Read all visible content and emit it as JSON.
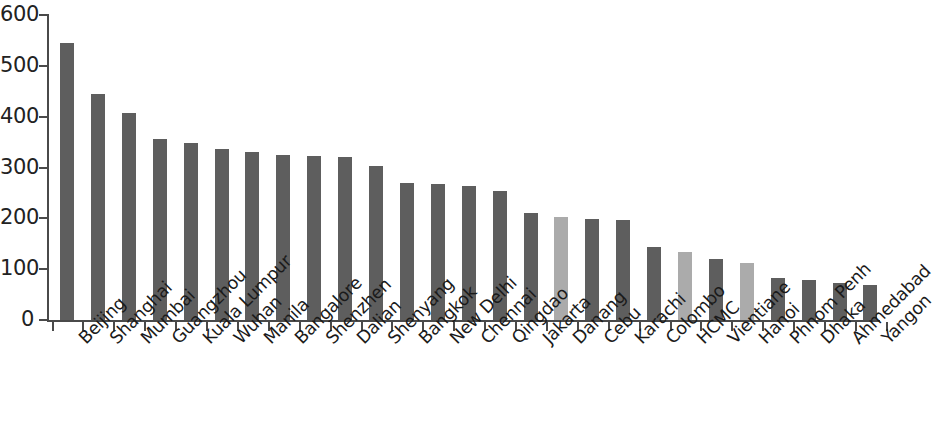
{
  "chart_data": {
    "type": "bar",
    "title": "",
    "subtitle": "",
    "xlabel": "",
    "ylabel": "",
    "ylim": [
      0,
      600
    ],
    "ytick_labels": [
      "0",
      "100",
      "200",
      "300",
      "400",
      "500",
      "600"
    ],
    "ytick_values": [
      0,
      100,
      200,
      300,
      400,
      500,
      600
    ],
    "grid": false,
    "legend": null,
    "categories": [
      "Beijing",
      "Shanghai",
      "Mumbai",
      "Guangzhou",
      "Kuala Lumpur",
      "Wuhan",
      "Manila",
      "Bangalore",
      "Shenzhen",
      "Dalian",
      "Shenyang",
      "Bangkok",
      "New Delhi",
      "Chennai",
      "Qingdao",
      "Jakarta",
      "Danang",
      "Cebu",
      "Karachi",
      "Colombo",
      "HCMC",
      "Vientiane",
      "Hanoi",
      "Phnom Penh",
      "Dhaka",
      "Ahmedabad",
      "Yangon"
    ],
    "values": [
      545,
      444,
      408,
      357,
      348,
      337,
      330,
      325,
      322,
      321,
      303,
      269,
      268,
      263,
      254,
      211,
      203,
      199,
      197,
      143,
      133,
      120,
      112,
      83,
      79,
      73,
      68
    ],
    "bar_colors": [
      "#5e5e5e",
      "#5e5e5e",
      "#5e5e5e",
      "#5e5e5e",
      "#5e5e5e",
      "#5e5e5e",
      "#5e5e5e",
      "#5e5e5e",
      "#5e5e5e",
      "#5e5e5e",
      "#5e5e5e",
      "#5e5e5e",
      "#5e5e5e",
      "#5e5e5e",
      "#5e5e5e",
      "#5e5e5e",
      "#ababab",
      "#5e5e5e",
      "#5e5e5e",
      "#5e5e5e",
      "#ababab",
      "#5e5e5e",
      "#ababab",
      "#5e5e5e",
      "#5e5e5e",
      "#5e5e5e",
      "#5e5e5e"
    ],
    "colors": {
      "bar_primary": "#5e5e5e",
      "bar_highlight": "#ababab",
      "axis": "#4a4a4a",
      "text": "#1a1a1a",
      "background": "#ffffff"
    }
  }
}
